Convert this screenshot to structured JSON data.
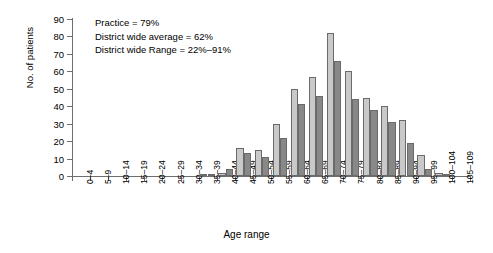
{
  "chart_data": {
    "type": "bar",
    "title": "",
    "xlabel": "Age range",
    "ylabel": "No. of patients",
    "ylim": [
      0,
      90
    ],
    "ytick_step": 10,
    "yticks": [
      0,
      10,
      20,
      30,
      40,
      50,
      60,
      70,
      80,
      90
    ],
    "grid": false,
    "legend": "none",
    "categories": [
      "0–4",
      "5–9",
      "10–14",
      "15–19",
      "20–24",
      "25–29",
      "30–34",
      "35–39",
      "40–44",
      "45–49",
      "50–54",
      "55–59",
      "60–64",
      "65–69",
      "70–74",
      "75–79",
      "80–84",
      "85–89",
      "90–94",
      "95–99",
      "100–104",
      "105–109"
    ],
    "series": [
      {
        "name": "light",
        "color": "#c9c9c9",
        "values": [
          0,
          0,
          0,
          0,
          0,
          0,
          0,
          1,
          2,
          16,
          15,
          30,
          50,
          57,
          82,
          60,
          45,
          40,
          32,
          12,
          2,
          0
        ]
      },
      {
        "name": "dark",
        "color": "#888888",
        "values": [
          0,
          0,
          0,
          0,
          0,
          0,
          0,
          1,
          4,
          13,
          11,
          22,
          41,
          46,
          66,
          44,
          38,
          31,
          19,
          4,
          1,
          0
        ]
      }
    ],
    "annotations": [
      "Practice = 79%",
      "District wide average = 62%",
      "District wide Range = 22%–91%"
    ]
  }
}
